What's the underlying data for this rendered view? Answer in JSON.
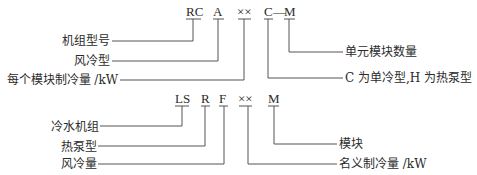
{
  "diagram1": {
    "codes": [
      "RC",
      "A",
      "××",
      "C",
      "—",
      "M"
    ],
    "left_labels": [
      "机组型号",
      "风冷型",
      "每个模块制冷量 /kW"
    ],
    "right_labels": [
      "单元模块数量",
      "C 为单冷型,H 为热泵型"
    ]
  },
  "diagram2": {
    "codes": [
      "LS",
      "R",
      "F",
      "××",
      "M"
    ],
    "left_labels": [
      "冷水机组",
      "热泵型",
      "风冷量"
    ],
    "right_labels": [
      "模块",
      "名义制冷量 /kW"
    ]
  }
}
